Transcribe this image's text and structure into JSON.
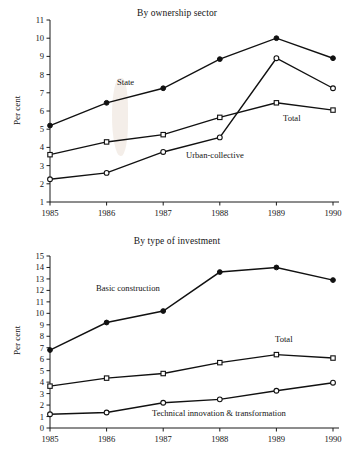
{
  "figure": {
    "ylabel": "Per cent",
    "x_categories": [
      "1985",
      "1986",
      "1987",
      "1988",
      "1989",
      "1990"
    ]
  },
  "top": {
    "title": "By ownership sector",
    "ylabel": "Per cent",
    "y_ticks": [
      "11",
      "10",
      "9",
      "8",
      "7",
      "6",
      "5",
      "4",
      "3",
      "2",
      "1"
    ],
    "x_ticks": [
      "1985",
      "1986",
      "1987",
      "1988",
      "1989",
      "1990"
    ],
    "labels": {
      "state": "State",
      "total": "Total",
      "urban_collective": "Urban-collective"
    }
  },
  "bottom": {
    "title": "By type of investment",
    "ylabel": "Per cent",
    "y_ticks": [
      "15",
      "14",
      "13",
      "12",
      "11",
      "10",
      "9",
      "8",
      "7",
      "6",
      "5",
      "4",
      "3",
      "2",
      "1",
      "0"
    ],
    "x_ticks": [
      "1985",
      "1986",
      "1987",
      "1988",
      "1989",
      "1990"
    ],
    "labels": {
      "basic_construction": "Basic construction",
      "total": "Total",
      "technical": "Technical innovation & transformation"
    }
  },
  "chart_data": [
    {
      "type": "line",
      "title": "By ownership sector",
      "xlabel": "",
      "ylabel": "Per cent",
      "categories": [
        "1985",
        "1986",
        "1987",
        "1988",
        "1989",
        "1990"
      ],
      "ylim": [
        1,
        11
      ],
      "ytick_step": 1,
      "grid": false,
      "legend": "inline-annotations",
      "series": [
        {
          "name": "State",
          "marker": "filled-circle",
          "values": [
            5.2,
            6.45,
            7.25,
            8.85,
            10.0,
            8.9
          ]
        },
        {
          "name": "Total",
          "marker": "open-square",
          "values": [
            3.6,
            4.3,
            4.7,
            5.65,
            6.45,
            6.05
          ]
        },
        {
          "name": "Urban-collective",
          "marker": "open-circle",
          "values": [
            2.25,
            2.6,
            3.75,
            4.55,
            8.9,
            7.25
          ]
        }
      ]
    },
    {
      "type": "line",
      "title": "By type of investment",
      "xlabel": "",
      "ylabel": "Per cent",
      "categories": [
        "1985",
        "1986",
        "1987",
        "1988",
        "1989",
        "1990"
      ],
      "ylim": [
        0,
        15
      ],
      "ytick_step": 1,
      "grid": false,
      "legend": "inline-annotations",
      "series": [
        {
          "name": "Basic construction",
          "marker": "filled-circle",
          "values": [
            6.8,
            9.2,
            10.2,
            13.6,
            14.0,
            12.9
          ]
        },
        {
          "name": "Total",
          "marker": "open-square",
          "values": [
            3.65,
            4.35,
            4.75,
            5.7,
            6.4,
            6.1
          ]
        },
        {
          "name": "Technical innovation & transformation",
          "marker": "open-circle",
          "values": [
            1.2,
            1.35,
            2.2,
            2.5,
            3.25,
            3.95
          ]
        }
      ]
    }
  ]
}
